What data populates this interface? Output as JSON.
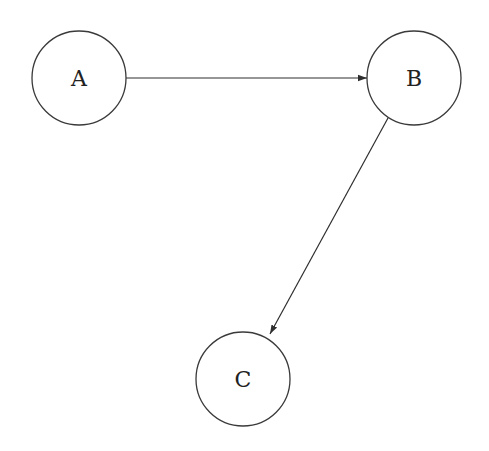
{
  "diagram": {
    "type": "directed-graph",
    "nodes": [
      {
        "id": "A",
        "label": "A",
        "cx": 79,
        "cy": 78,
        "r": 47
      },
      {
        "id": "B",
        "label": "B",
        "cx": 414,
        "cy": 78,
        "r": 47
      },
      {
        "id": "C",
        "label": "C",
        "cx": 243,
        "cy": 379,
        "r": 47
      }
    ],
    "edges": [
      {
        "from": "A",
        "to": "B",
        "x1": 126,
        "y1": 78,
        "x2": 367,
        "y2": 78
      },
      {
        "from": "B",
        "to": "C",
        "x1": 388,
        "y1": 118,
        "x2": 270,
        "y2": 334
      }
    ],
    "colors": {
      "background": "#ffffff",
      "stroke": "#3a3a3a",
      "text": "#222222"
    }
  }
}
